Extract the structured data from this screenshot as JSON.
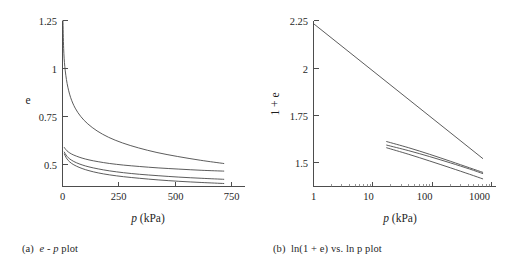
{
  "figure": {
    "panels": [
      {
        "id": "panel-a",
        "caption_label": "(a)",
        "caption_text_parts": {
          "sym1": "e",
          "dash": "-",
          "sym2": "p",
          "suffix": "plot"
        },
        "caption_full": "(a)  e - p plot",
        "chart_data": {
          "type": "line",
          "title": "",
          "xlabel": "p (kPa)",
          "ylabel": "e",
          "xlabel_symbol": "p",
          "xlabel_units": "(kPa)",
          "xscale": "linear",
          "yscale": "linear",
          "xlim": [
            0,
            790
          ],
          "ylim": [
            0.42,
            1.25
          ],
          "xticks": [
            0,
            250,
            500,
            750
          ],
          "xticklabels": [
            "0",
            "250",
            "500",
            "750"
          ],
          "yticks": [
            0.5,
            0.75,
            1,
            1.25
          ],
          "yticklabels": [
            "0.5",
            "0.75",
            "1",
            "1.25"
          ],
          "grid": false,
          "legend": "none",
          "series": [
            {
              "name": "curve-1",
              "x": [
                2,
                5,
                10,
                20,
                35,
                55,
                80,
                110,
                150,
                200,
                260,
                330,
                410,
                500,
                600,
                700
              ],
              "y": [
                1.25,
                1.11,
                1.02,
                0.935,
                0.866,
                0.812,
                0.769,
                0.733,
                0.698,
                0.666,
                0.638,
                0.613,
                0.59,
                0.57,
                0.551,
                0.535
              ]
            },
            {
              "name": "curve-2",
              "x": [
                8,
                15,
                25,
                40,
                60,
                85,
                115,
                155,
                205,
                265,
                335,
                415,
                505,
                605,
                700
              ],
              "y": [
                0.615,
                0.604,
                0.593,
                0.582,
                0.572,
                0.562,
                0.553,
                0.544,
                0.535,
                0.527,
                0.52,
                0.513,
                0.507,
                0.501,
                0.497
              ]
            },
            {
              "name": "curve-3",
              "x": [
                8,
                15,
                25,
                40,
                60,
                85,
                115,
                155,
                205,
                265,
                335,
                415,
                505,
                605,
                700
              ],
              "y": [
                0.592,
                0.578,
                0.564,
                0.551,
                0.539,
                0.528,
                0.518,
                0.508,
                0.498,
                0.489,
                0.481,
                0.474,
                0.467,
                0.461,
                0.456
              ]
            },
            {
              "name": "curve-4",
              "x": [
                8,
                15,
                25,
                40,
                60,
                85,
                115,
                155,
                205,
                265,
                335,
                415,
                505,
                605,
                700
              ],
              "y": [
                0.583,
                0.566,
                0.55,
                0.535,
                0.522,
                0.51,
                0.499,
                0.488,
                0.478,
                0.469,
                0.461,
                0.453,
                0.446,
                0.44,
                0.435
              ]
            }
          ]
        }
      },
      {
        "id": "panel-b",
        "caption_label": "(b)",
        "caption_text_parts": {
          "lead": "ln(1 + e)",
          "vs": "vs.",
          "sym": "ln p",
          "suffix": "plot"
        },
        "caption_full": "(b)  ln(1 + e) vs. ln p plot",
        "chart_data": {
          "type": "line",
          "title": "",
          "xlabel": "p (kPa)",
          "ylabel": "1 + e",
          "xlabel_symbol": "p",
          "xlabel_units": "(kPa)",
          "xscale": "log",
          "yscale": "log",
          "xlim": [
            1,
            1150
          ],
          "ylim": [
            1.41,
            2.26
          ],
          "xticks": [
            1,
            10,
            100,
            1000
          ],
          "xticklabels": [
            "1",
            "10",
            "100",
            "1000"
          ],
          "yticks": [
            1.5,
            1.75,
            2,
            2.25
          ],
          "yticklabels": [
            "1.5",
            "1.75",
            "2",
            "2.25"
          ],
          "grid": false,
          "legend": "none",
          "series": [
            {
              "name": "curve-1",
              "x": [
                1,
                700
              ],
              "y": [
                2.24,
                1.527
              ]
            },
            {
              "name": "curve-2",
              "x": [
                17,
                40,
                90,
                200,
                420,
                700
              ],
              "y": [
                1.602,
                1.574,
                1.545,
                1.515,
                1.487,
                1.468
              ]
            },
            {
              "name": "curve-3",
              "x": [
                17,
                40,
                90,
                200,
                420,
                700
              ],
              "y": [
                1.586,
                1.561,
                1.535,
                1.508,
                1.482,
                1.463
              ]
            },
            {
              "name": "curve-4",
              "x": [
                17,
                40,
                90,
                200,
                420,
                700
              ],
              "y": [
                1.574,
                1.545,
                1.516,
                1.487,
                1.46,
                1.441
              ]
            }
          ]
        }
      }
    ]
  }
}
